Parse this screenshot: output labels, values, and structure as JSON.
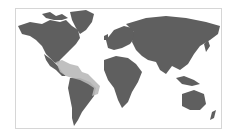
{
  "map": {
    "type": "world-range-map",
    "projection": "equirectangular-like",
    "land_color": "#5f5f5f",
    "highlight_color": "#b9b9b9",
    "ocean_color": "#ffffff",
    "frame_color": "#d6d6d6",
    "highlighted_region": "Central America, Caribbean and northern/eastern South America coast"
  }
}
